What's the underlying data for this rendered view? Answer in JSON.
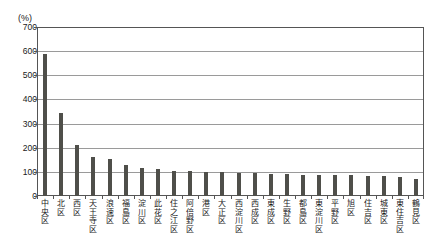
{
  "chart_data": {
    "type": "bar",
    "title": "",
    "subtitle": "",
    "xlabel": "",
    "ylabel": "(%)",
    "unit_label": "(%)",
    "ylim": [
      0,
      700
    ],
    "ytick_step": 100,
    "yticks": [
      0,
      100,
      200,
      300,
      400,
      500,
      600,
      700
    ],
    "ytick_labels": [
      "0",
      "100",
      "200",
      "300",
      "400",
      "500",
      "600",
      "700"
    ],
    "grid": true,
    "grid_axis": "y",
    "legend": false,
    "legend_position": "none",
    "bar_color": "#4f4f4a",
    "axis_color": "#555555",
    "gridline_color": "#9a9a9a",
    "background_color": "#ffffff",
    "categories": [
      "中央区",
      "北区",
      "西区",
      "天王寺区",
      "浪速区",
      "福島区",
      "淀川区",
      "此花区",
      "住之江区",
      "阿倍野区",
      "港区",
      "大正区",
      "西淀川区",
      "西成区",
      "東成区",
      "生野区",
      "都島区",
      "東淀川区",
      "平野区",
      "旭区",
      "住吉区",
      "城東区",
      "東住吉区",
      "鶴見区"
    ],
    "values": [
      590,
      343,
      212,
      163,
      152,
      128,
      117,
      110,
      105,
      102,
      100,
      98,
      96,
      95,
      93,
      91,
      89,
      88,
      87,
      85,
      83,
      81,
      78,
      72
    ]
  }
}
